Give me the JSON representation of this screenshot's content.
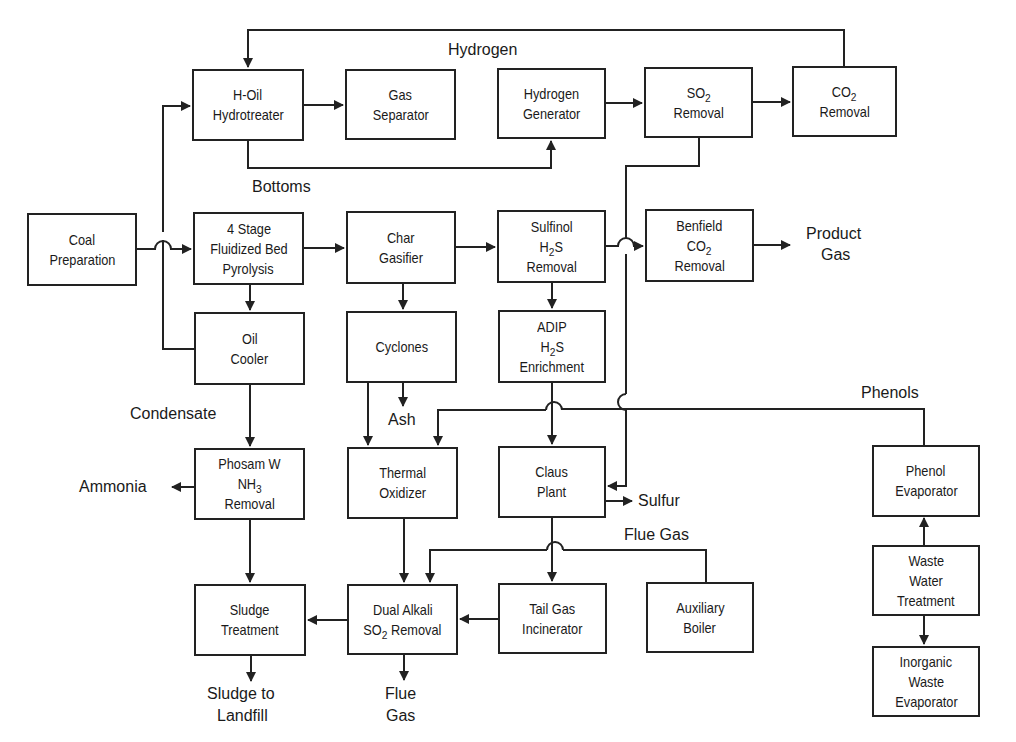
{
  "diagram": {
    "colors": {
      "line": "#222222",
      "text": "#1a1a1a",
      "background": "#ffffff"
    },
    "boxes": {
      "h_oil": {
        "lines": [
          "H-Oil",
          "Hydrotreater"
        ]
      },
      "gas_separator": {
        "lines": [
          "Gas",
          "Separator"
        ]
      },
      "hydrogen_generator": {
        "lines": [
          "Hydrogen",
          "Generator"
        ]
      },
      "so2_removal": {
        "lines": [
          "SO2",
          "Removal"
        ]
      },
      "co2_removal": {
        "lines": [
          "CO2",
          "Removal"
        ]
      },
      "coal_preparation": {
        "lines": [
          "Coal",
          "Preparation"
        ]
      },
      "pyrolysis": {
        "lines": [
          "4 Stage",
          "Fluidized Bed",
          "Pyrolysis"
        ]
      },
      "char_gasifier": {
        "lines": [
          "Char",
          "Gasifier"
        ]
      },
      "sulfinol": {
        "lines": [
          "Sulfinol",
          "H2S",
          "Removal"
        ]
      },
      "benfield": {
        "lines": [
          "Benfield",
          "CO2",
          "Removal"
        ]
      },
      "oil_cooler": {
        "lines": [
          "Oil",
          "Cooler"
        ]
      },
      "cyclones": {
        "lines": [
          "Cyclones"
        ]
      },
      "adip": {
        "lines": [
          "ADIP",
          "H2S",
          "Enrichment"
        ]
      },
      "phosam": {
        "lines": [
          "Phosam W",
          "NH3",
          "Removal"
        ]
      },
      "thermal_oxidizer": {
        "lines": [
          "Thermal",
          "Oxidizer"
        ]
      },
      "claus_plant": {
        "lines": [
          "Claus",
          "Plant"
        ]
      },
      "phenol_evaporator": {
        "lines": [
          "Phenol",
          "Evaporator"
        ]
      },
      "waste_water": {
        "lines": [
          "Waste",
          "Water",
          "Treatment"
        ]
      },
      "inorganic": {
        "lines": [
          "Inorganic",
          "Waste",
          "Evaporator"
        ]
      },
      "sludge_treatment": {
        "lines": [
          "Sludge",
          "Treatment"
        ]
      },
      "dual_alkali": {
        "lines": [
          "Dual Alkali",
          "SO2 Removal"
        ]
      },
      "tail_gas": {
        "lines": [
          "Tail Gas",
          "Incinerator"
        ]
      },
      "auxiliary_boiler": {
        "lines": [
          "Auxiliary",
          "Boiler"
        ]
      }
    },
    "labels": {
      "hydrogen": "Hydrogen",
      "bottoms": "Bottoms",
      "product_gas_1": "Product",
      "product_gas_2": "Gas",
      "condensate": "Condensate",
      "ash": "Ash",
      "phenols": "Phenols",
      "ammonia": "Ammonia",
      "sulfur": "Sulfur",
      "flue_gas_top": "Flue Gas",
      "sludge_landfill_1": "Sludge to",
      "sludge_landfill_2": "Landfill",
      "flue_gas_bottom_1": "Flue",
      "flue_gas_bottom_2": "Gas"
    }
  }
}
